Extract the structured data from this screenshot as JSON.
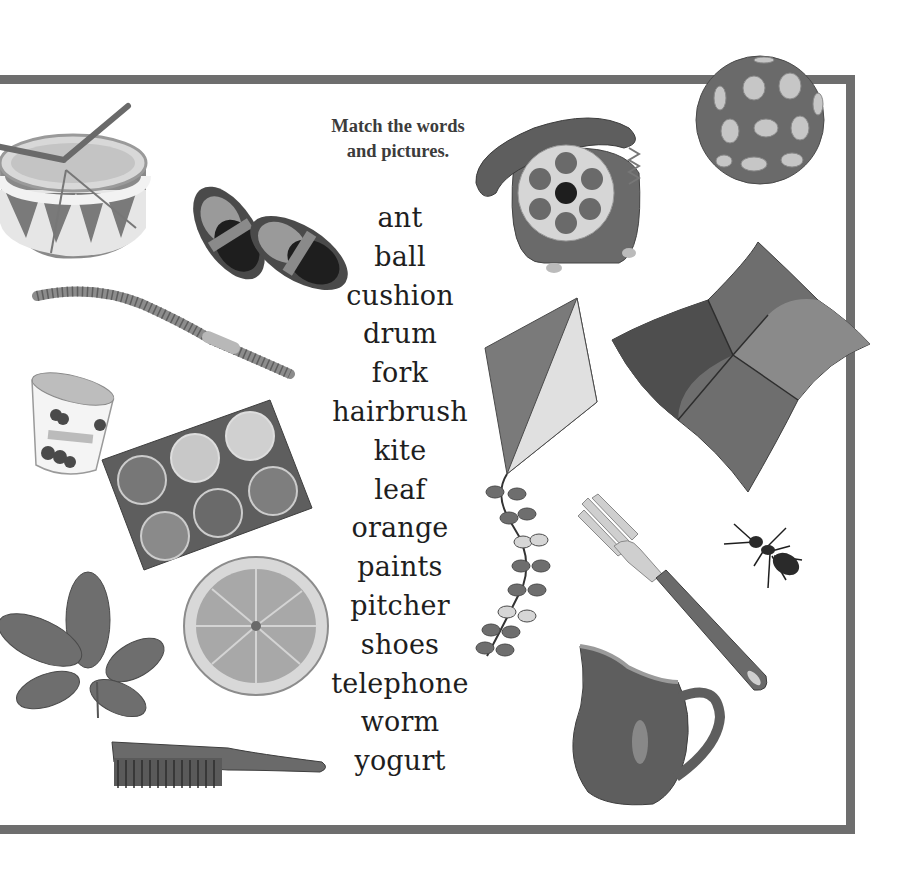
{
  "page": {
    "instruction": "Match the words and pictures.",
    "instruction_lines": [
      "Match the words",
      "and pictures."
    ],
    "border_color": "#6e6e6e"
  },
  "words": [
    "ant",
    "ball",
    "cushion",
    "drum",
    "fork",
    "hairbrush",
    "kite",
    "leaf",
    "orange",
    "paints",
    "pitcher",
    "shoes",
    "telephone",
    "worm",
    "yogurt"
  ],
  "pictures": [
    {
      "name": "drum",
      "icon": "drum-icon"
    },
    {
      "name": "shoes",
      "icon": "shoes-icon"
    },
    {
      "name": "worm",
      "icon": "worm-icon"
    },
    {
      "name": "yogurt",
      "icon": "yogurt-icon"
    },
    {
      "name": "paints",
      "icon": "paints-icon"
    },
    {
      "name": "leaf",
      "icon": "leaf-icon"
    },
    {
      "name": "orange",
      "icon": "orange-icon"
    },
    {
      "name": "hairbrush",
      "icon": "hairbrush-icon"
    },
    {
      "name": "telephone",
      "icon": "telephone-icon"
    },
    {
      "name": "ball",
      "icon": "ball-icon"
    },
    {
      "name": "kite",
      "icon": "kite-icon"
    },
    {
      "name": "cushion",
      "icon": "cushion-icon"
    },
    {
      "name": "fork",
      "icon": "fork-icon"
    },
    {
      "name": "ant",
      "icon": "ant-icon"
    },
    {
      "name": "pitcher",
      "icon": "pitcher-icon"
    }
  ]
}
